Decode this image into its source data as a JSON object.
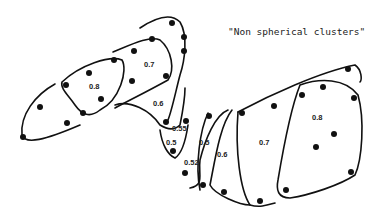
{
  "title": "\"Non spherical clusters\"",
  "labels": {
    "l08a": "0.8",
    "l07a": "0.7",
    "l06a": "0.6",
    "l055": "0.55",
    "l05a": "0.5",
    "l052": "0.52",
    "l05b": "0.5",
    "l06b": "0.6",
    "l07b": "0.7",
    "l08b": "0.8"
  },
  "colors": {
    "ink": "#111111",
    "background": "#ffffff"
  }
}
